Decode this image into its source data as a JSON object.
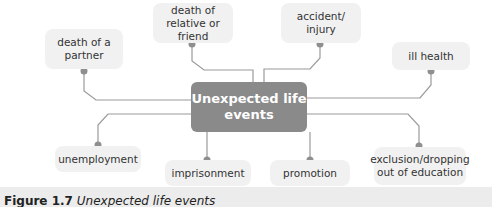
{
  "diagram": {
    "center": "Unexpected life events",
    "nodes": [
      {
        "id": "death-of-partner",
        "label": "death of a partner"
      },
      {
        "id": "death-of-relative",
        "label": "death of relative or friend"
      },
      {
        "id": "accident",
        "label": "accident/ injury"
      },
      {
        "id": "ill-health",
        "label": "ill health"
      },
      {
        "id": "unemployment",
        "label": "unemployment"
      },
      {
        "id": "imprisonment",
        "label": "imprisonment"
      },
      {
        "id": "promotion",
        "label": "promotion"
      },
      {
        "id": "exclusion",
        "label": "exclusion/dropping out of education"
      }
    ],
    "colors": {
      "center": "#8a8a8a",
      "node_bg": "#f1f1f1",
      "line": "#999999",
      "dot": "#8f8f8f"
    }
  },
  "caption": {
    "figure": "Figure 1.7",
    "text": "Unexpected life events"
  }
}
